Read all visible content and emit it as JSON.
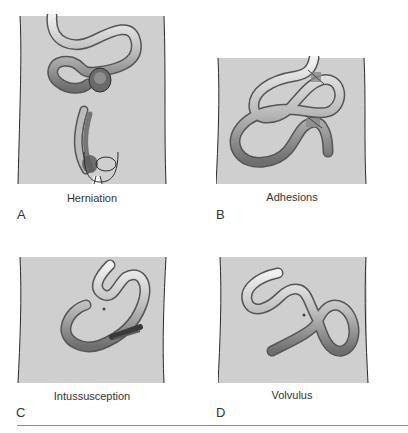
{
  "figure": {
    "panels": [
      {
        "letter": "A",
        "caption": "Herniation"
      },
      {
        "letter": "B",
        "caption": "Adhesions"
      },
      {
        "letter": "C",
        "caption": "Intussusception"
      },
      {
        "letter": "D",
        "caption": "Volvulus"
      }
    ],
    "colors": {
      "abdomen_fill": "#cfcfcf",
      "outline": "#2b2b2b",
      "bowel_light": "#e6e6e6",
      "bowel_dark": "#7a7a7a",
      "rule": "#8a8a8a"
    }
  }
}
